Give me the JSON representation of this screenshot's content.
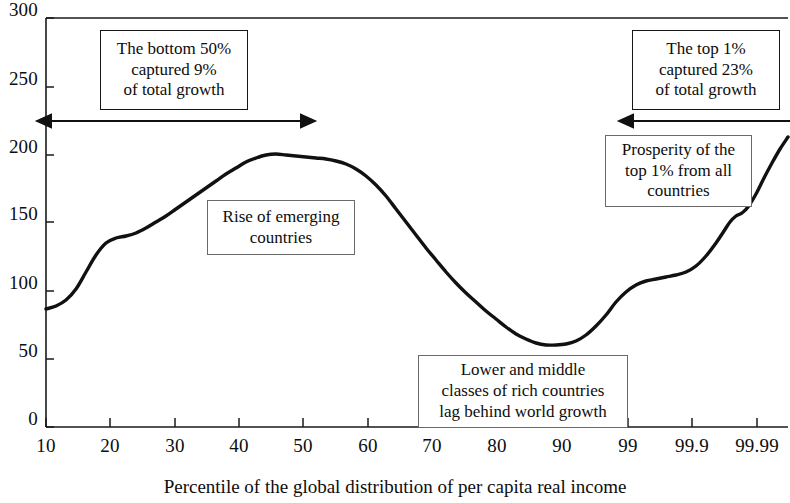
{
  "chart_data": {
    "type": "line",
    "title": "",
    "subtitle": "",
    "xlabel": "Percentile of the global distribution of per capita real income",
    "ylabel": "",
    "grid": false,
    "legend": "none",
    "xscale": "ordinal-percentile",
    "ylim": [
      0,
      300
    ],
    "y_ticks": [
      "0",
      "50",
      "100",
      "150",
      "200",
      "250",
      "300"
    ],
    "y_tick_values": [
      0,
      50,
      100,
      150,
      200,
      250,
      300
    ],
    "x_ticks": [
      "10",
      "20",
      "30",
      "40",
      "50",
      "60",
      "70",
      "80",
      "90",
      "99",
      "99.9",
      "99.99"
    ],
    "series": [
      {
        "name": "Cumulative real income growth by percentile",
        "x": [
          "10",
          "15",
          "20",
          "25",
          "30",
          "35",
          "40",
          "45",
          "50",
          "55",
          "60",
          "65",
          "70",
          "75",
          "80",
          "85",
          "90",
          "95",
          "99",
          "99.5",
          "99.9",
          "99.95",
          "99.99"
        ],
        "values": [
          87,
          97,
          135,
          143,
          155,
          170,
          186,
          199,
          198,
          195,
          192,
          175,
          140,
          100,
          75,
          64,
          63,
          80,
          110,
          114,
          132,
          155,
          212
        ]
      }
    ],
    "annotations": [
      {
        "id": "bottom-50",
        "text": "The bottom 50%\ncaptured 9%\nof total growth",
        "box": {
          "x": 100,
          "y": 30,
          "w": 148,
          "h": 80
        },
        "emphasis": "strong"
      },
      {
        "id": "rise-emerging",
        "text": "Rise of emerging\ncountries",
        "box": {
          "x": 207,
          "y": 200,
          "w": 148,
          "h": 55
        },
        "emphasis": "light"
      },
      {
        "id": "lower-middle-rich",
        "text": "Lower and middle\nclasses of rich countries\nlag behind world growth",
        "box": {
          "x": 418,
          "y": 355,
          "w": 210,
          "h": 73
        },
        "emphasis": "light"
      },
      {
        "id": "top-1-growth",
        "text": "The top 1%\ncaptured 23%\nof total growth",
        "box": {
          "x": 632,
          "y": 30,
          "w": 148,
          "h": 80
        },
        "emphasis": "strong"
      },
      {
        "id": "prosperity-top-1",
        "text": "Prosperity of the\ntop 1% from all\ncountries",
        "box": {
          "x": 605,
          "y": 135,
          "w": 147,
          "h": 72
        },
        "emphasis": "light"
      }
    ],
    "span_arrows": [
      {
        "id": "bottom-50-span",
        "from_percentile": "10",
        "to_percentile": "50",
        "y": 121
      },
      {
        "id": "top-1-span",
        "from_percentile": "99",
        "to_percentile": "99.99",
        "y": 121
      }
    ],
    "colors": {
      "curve": "#111111",
      "axis": "#1a1a1a",
      "annotation_border": "#6a6a6a",
      "annotation_border_strong": "#151515",
      "background": "#ffffff",
      "text": "#0d0d0d"
    }
  },
  "geometry": {
    "plot": {
      "left": 46,
      "right": 788,
      "top": 18,
      "bottom": 427
    },
    "y_tick_px": [
      427,
      359,
      291,
      222,
      155,
      87,
      18
    ],
    "x_tick_px": [
      46,
      110,
      175,
      239,
      303,
      368,
      432,
      497,
      562,
      628,
      692,
      757
    ],
    "curve_px": [
      [
        46,
        309
      ],
      [
        56,
        306
      ],
      [
        66,
        300
      ],
      [
        76,
        289
      ],
      [
        86,
        272
      ],
      [
        96,
        255
      ],
      [
        106,
        243
      ],
      [
        116,
        238
      ],
      [
        126,
        236
      ],
      [
        136,
        233
      ],
      [
        146,
        228
      ],
      [
        156,
        222
      ],
      [
        166,
        216
      ],
      [
        176,
        209
      ],
      [
        186,
        202
      ],
      [
        196,
        195
      ],
      [
        206,
        188
      ],
      [
        216,
        181
      ],
      [
        226,
        174
      ],
      [
        236,
        168
      ],
      [
        246,
        162
      ],
      [
        256,
        158
      ],
      [
        266,
        155
      ],
      [
        276,
        154
      ],
      [
        286,
        155
      ],
      [
        296,
        156
      ],
      [
        306,
        157
      ],
      [
        316,
        158
      ],
      [
        326,
        159
      ],
      [
        336,
        161
      ],
      [
        346,
        164
      ],
      [
        356,
        169
      ],
      [
        366,
        176
      ],
      [
        376,
        185
      ],
      [
        386,
        196
      ],
      [
        396,
        209
      ],
      [
        406,
        222
      ],
      [
        416,
        235
      ],
      [
        426,
        248
      ],
      [
        436,
        260
      ],
      [
        446,
        272
      ],
      [
        456,
        283
      ],
      [
        466,
        293
      ],
      [
        476,
        302
      ],
      [
        486,
        311
      ],
      [
        496,
        319
      ],
      [
        506,
        327
      ],
      [
        516,
        334
      ],
      [
        526,
        339
      ],
      [
        536,
        343
      ],
      [
        546,
        345
      ],
      [
        556,
        345
      ],
      [
        566,
        344
      ],
      [
        576,
        341
      ],
      [
        586,
        335
      ],
      [
        596,
        326
      ],
      [
        606,
        315
      ],
      [
        616,
        302
      ],
      [
        626,
        292
      ],
      [
        636,
        285
      ],
      [
        646,
        281
      ],
      [
        656,
        279
      ],
      [
        666,
        277
      ],
      [
        676,
        275
      ],
      [
        686,
        272
      ],
      [
        696,
        266
      ],
      [
        706,
        256
      ],
      [
        716,
        243
      ],
      [
        724,
        231
      ],
      [
        730,
        222
      ],
      [
        736,
        216
      ],
      [
        742,
        213
      ],
      [
        748,
        207
      ],
      [
        756,
        194
      ],
      [
        764,
        178
      ],
      [
        772,
        163
      ],
      [
        780,
        149
      ],
      [
        788,
        137
      ]
    ]
  }
}
